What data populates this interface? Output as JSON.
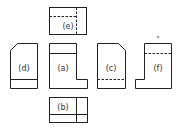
{
  "colors": {
    "stroke": "#222222",
    "background": "#ffffff"
  },
  "views": [
    {
      "id": "a",
      "label": "(a)",
      "position": "front"
    },
    {
      "id": "b",
      "label": "(b)",
      "position": "bottom"
    },
    {
      "id": "c",
      "label": "(c)",
      "position": "right-of-front"
    },
    {
      "id": "d",
      "label": "(d)",
      "position": "left-of-front"
    },
    {
      "id": "e",
      "label": "(e)",
      "position": "top"
    },
    {
      "id": "f",
      "label": "(f)",
      "position": "rear"
    }
  ],
  "marker": "*"
}
